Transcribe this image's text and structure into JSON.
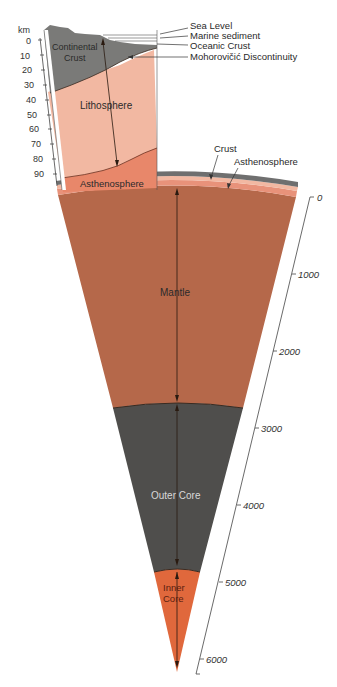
{
  "colors": {
    "continental_crust": "#7a7a78",
    "lithosphere": "#f2b8a2",
    "asthenosphere": "#e8876a",
    "mantle": "#b5684a",
    "outer_core": "#4f4e4c",
    "inner_core": "#e0683c",
    "crust_thin": "#6f6f6f"
  },
  "top_section": {
    "unit": "km",
    "ticks": [
      "0",
      "10",
      "20",
      "30",
      "40",
      "50",
      "60",
      "70",
      "80",
      "90"
    ],
    "layers": {
      "continental_crust": "Continental Crust",
      "continental_crust_line1": "Continental",
      "continental_crust_line2": "Crust",
      "lithosphere": "Lithosphere",
      "asthenosphere": "Asthenosphere"
    },
    "callouts": [
      "Sea Level",
      "Marine sediment",
      "Oceanic Crust",
      "Mohorovičić Discontinuity"
    ]
  },
  "main_section": {
    "callouts": [
      "Crust",
      "Asthenosphere"
    ],
    "layers": {
      "mantle": "Mantle",
      "outer_core": "Outer Core",
      "inner_core_line1": "Inner",
      "inner_core_line2": "Core"
    },
    "scale_ticks": [
      "0",
      "1000",
      "2000",
      "3000",
      "4000",
      "5000",
      "6000"
    ]
  }
}
